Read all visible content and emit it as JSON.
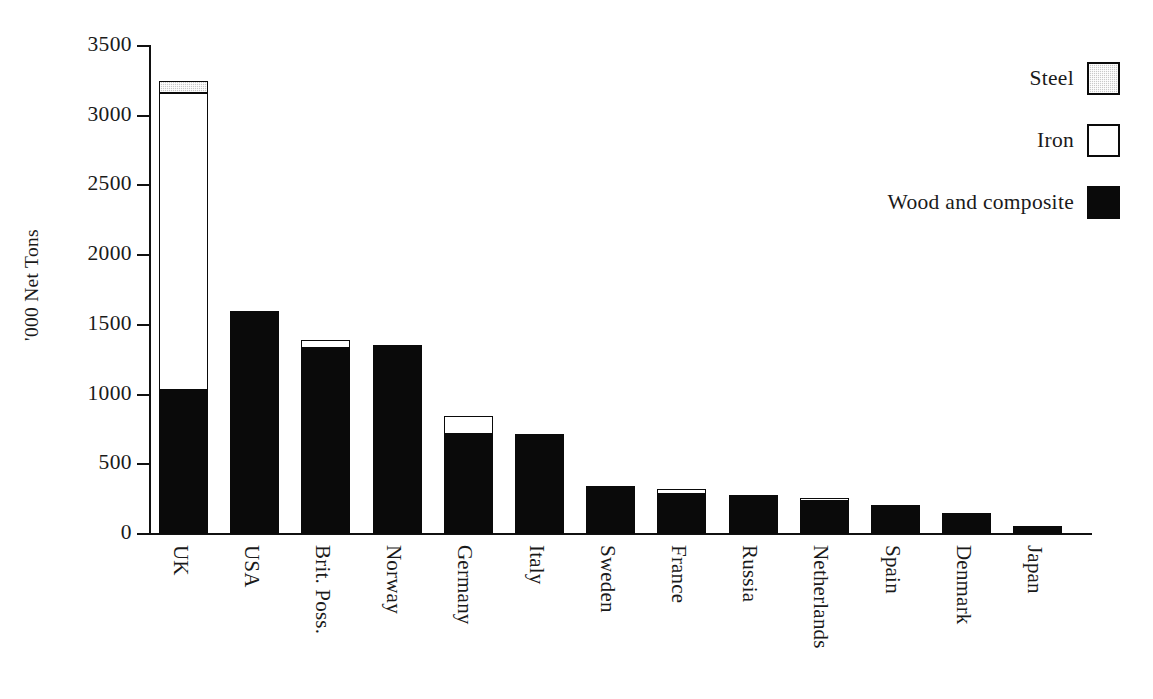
{
  "figure": {
    "cropped_top_line": "",
    "y_axis_title": "'000 Net Tons"
  },
  "legend": {
    "position": "top-right",
    "entries": [
      {
        "label": "Steel",
        "swatch": "stippled-gray-square-icon",
        "color": "#c9c9c9"
      },
      {
        "label": "Iron",
        "swatch": "white-square-icon",
        "color": "#ffffff"
      },
      {
        "label": "Wood and composite",
        "swatch": "black-square-icon",
        "color": "#0a0a0a"
      }
    ]
  },
  "axes": {
    "y_ticks": [
      "0",
      "500",
      "1000",
      "1500",
      "2000",
      "2500",
      "3000",
      "3500"
    ],
    "y_tick_values": [
      0,
      500,
      1000,
      1500,
      2000,
      2500,
      3000,
      3500
    ],
    "x_tick_labels": [
      "UK",
      "USA",
      "Brit. Poss.",
      "Norway",
      "Germany",
      "Italy",
      "Sweden",
      "France",
      "Russia",
      "Netherlands",
      "Spain",
      "Denmark",
      "Japan"
    ]
  },
  "chart_data": {
    "type": "bar",
    "stacked": true,
    "title": "",
    "xlabel": "",
    "ylabel": "'000 Net Tons",
    "ylim": [
      0,
      3500
    ],
    "ytick_step": 500,
    "grid": false,
    "legend_position": "top-right",
    "categories": [
      "UK",
      "USA",
      "Brit. Poss.",
      "Norway",
      "Germany",
      "Italy",
      "Sweden",
      "France",
      "Russia",
      "Netherlands",
      "Spain",
      "Denmark",
      "Japan"
    ],
    "series": [
      {
        "name": "Wood and composite",
        "color": "#0a0a0a",
        "values": [
          1030,
          1600,
          1335,
          1355,
          715,
          715,
          345,
          290,
          280,
          240,
          205,
          150,
          60
        ]
      },
      {
        "name": "Iron",
        "color": "#ffffff",
        "values": [
          2130,
          0,
          55,
          0,
          135,
          0,
          0,
          35,
          0,
          20,
          0,
          0,
          0
        ]
      },
      {
        "name": "Steel",
        "color": "#c9c9c9",
        "values": [
          90,
          0,
          0,
          0,
          0,
          0,
          0,
          0,
          0,
          0,
          0,
          0,
          0
        ]
      }
    ],
    "totals": [
      3250,
      1600,
      1390,
      1355,
      850,
      715,
      345,
      325,
      280,
      260,
      205,
      150,
      60
    ]
  }
}
